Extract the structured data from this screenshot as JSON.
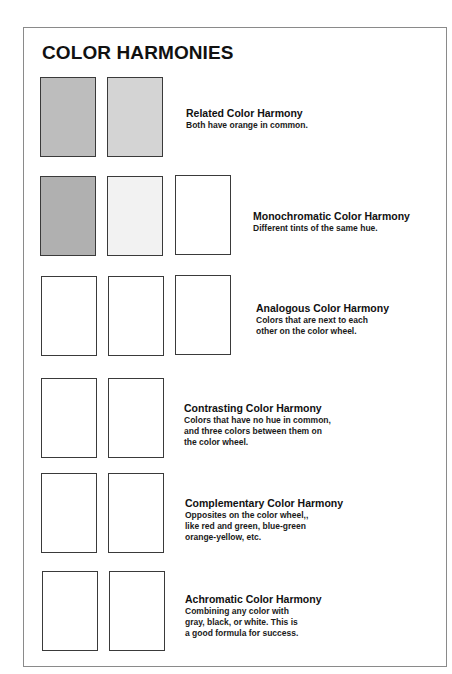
{
  "title": "COLOR HARMONIES",
  "sections": [
    {
      "heading": "Related Color Harmony",
      "lines": [
        "Both have orange in common."
      ],
      "swatches": [
        "#bdbdbd",
        "#d4d4d4"
      ]
    },
    {
      "heading": "Monochromatic Color Harmony",
      "lines": [
        "Different tints of the same hue."
      ],
      "swatches": [
        "#fafafa",
        "#c6c6c6",
        "#a2a2a2"
      ]
    },
    {
      "heading": "Analogous Color Harmony",
      "lines": [
        "Colors that are next to each",
        "other on the color wheel."
      ],
      "swatches": [
        "#c3c3c3",
        "#8c8c8c",
        "#777777"
      ]
    },
    {
      "heading": "Contrasting Color Harmony",
      "lines": [
        "Colors that have no hue in common,",
        "and three colors between them on",
        "the color wheel."
      ],
      "swatches": [
        "#b0b0b0",
        "#f2f2f2"
      ]
    },
    {
      "heading": "Complementary Color Harmony",
      "lines": [
        "Opposites on the color wheel,,",
        "like red and green, blue-green",
        "orange-yellow, etc."
      ],
      "swatches": [
        "#a7a7a7",
        "#7a7a7a"
      ]
    },
    {
      "heading": "Achromatic Color Harmony",
      "lines": [
        "Combining any color with",
        "gray, black, or white. This is",
        "a good formula for success."
      ],
      "swatches": [
        "#c9c9c9",
        "#e8e8e8"
      ]
    }
  ]
}
